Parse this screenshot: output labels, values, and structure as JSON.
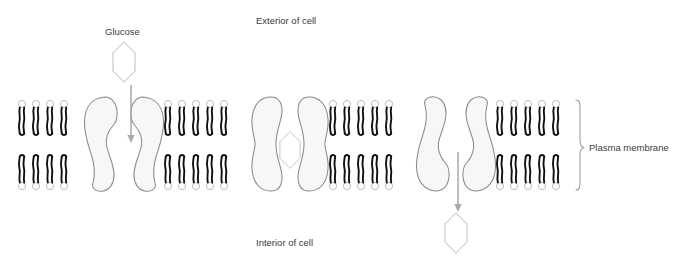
{
  "diagram": {
    "title_labels": {
      "exterior": "Exterior of cell",
      "interior": "Interior of cell",
      "glucose": "Glucose",
      "plasma_membrane": "Plasma membrane"
    },
    "colors": {
      "background": "#ffffff",
      "lipid_tail": "#111111",
      "lipid_head_stroke": "#b5b5b5",
      "lipid_head_fill": "#ffffff",
      "protein_stroke": "#8a8a8a",
      "protein_fill": "#f7f7f7",
      "glucose_stroke": "#c2c2c2",
      "glucose_fill": "#ffffff",
      "arrow": "#a8a8a8",
      "brace": "#9a9a9a",
      "text": "#3b3b3b"
    },
    "membrane": {
      "top_y": 100,
      "bottom_y": 190,
      "left_x": 18,
      "right_x": 570,
      "leaflets": 2
    },
    "lipid_groups": [
      {
        "name": "lipid-group-1",
        "start_x": 22,
        "count": 4,
        "spacing": 14
      },
      {
        "name": "lipid-group-2",
        "start_x": 168,
        "count": 5,
        "spacing": 14
      },
      {
        "name": "lipid-group-3",
        "start_x": 333,
        "count": 5,
        "spacing": 14
      },
      {
        "name": "lipid-group-4",
        "start_x": 500,
        "count": 5,
        "spacing": 14
      }
    ],
    "proteins": [
      {
        "name": "transport-protein-open-outward",
        "center_x": 124,
        "state": "open-outward",
        "has_arrow": true,
        "has_glucose_bound": false
      },
      {
        "name": "transport-protein-occluded",
        "center_x": 290,
        "state": "occluded",
        "has_arrow": false,
        "has_glucose_bound": true
      },
      {
        "name": "transport-protein-open-inward",
        "center_x": 456,
        "state": "open-inward",
        "has_arrow": true,
        "has_glucose_bound": false
      }
    ],
    "glucose_molecules": [
      {
        "name": "glucose-extracellular",
        "cx": 124,
        "cy": 62,
        "location": "exterior"
      },
      {
        "name": "glucose-bound",
        "cx": 290,
        "cy": 150,
        "location": "inside-protein"
      },
      {
        "name": "glucose-intracellular",
        "cx": 456,
        "cy": 233,
        "location": "interior"
      }
    ],
    "arrows": [
      {
        "name": "arrow-glucose-entering",
        "x": 131,
        "y1": 85,
        "y2": 142,
        "direction": "down"
      },
      {
        "name": "arrow-glucose-exiting",
        "x": 458,
        "y1": 152,
        "y2": 212,
        "direction": "down"
      }
    ],
    "text_positions": {
      "exterior": {
        "x": 256,
        "y": 24
      },
      "interior": {
        "x": 256,
        "y": 246
      },
      "glucose": {
        "x": 105,
        "y": 35
      },
      "plasma_membrane": {
        "x": 589,
        "y": 148
      }
    }
  }
}
